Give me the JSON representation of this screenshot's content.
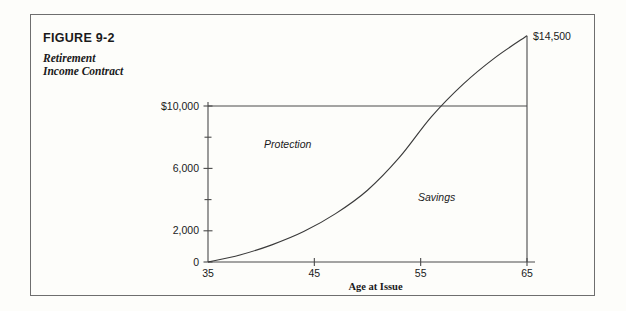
{
  "figure": {
    "number": "FIGURE 9-2",
    "subtitle": "Retirement\nIncome Contract"
  },
  "chart_data": {
    "type": "area",
    "title": "Retirement Income Contract",
    "xlabel": "Age at Issue",
    "ylabel": "",
    "xlim": [
      35,
      65
    ],
    "ylim": [
      0,
      14500
    ],
    "grid": false,
    "legend_position": "inline-annotations",
    "x_ticks": [
      {
        "value": 35,
        "label": "35"
      },
      {
        "value": 45,
        "label": "45"
      },
      {
        "value": 55,
        "label": "55"
      },
      {
        "value": 65,
        "label": "65"
      }
    ],
    "y_ticks": [
      {
        "value": 0,
        "label": "0"
      },
      {
        "value": 2000,
        "label": "2,000"
      },
      {
        "value": 4000,
        "label": ""
      },
      {
        "value": 6000,
        "label": "6,000"
      },
      {
        "value": 8000,
        "label": ""
      },
      {
        "value": 10000,
        "label": "$10,000"
      }
    ],
    "series": [
      {
        "name": "Cash Value",
        "x": [
          35,
          38,
          41,
          44,
          47,
          50,
          53,
          56,
          59,
          62,
          65
        ],
        "values": [
          0,
          450,
          1100,
          1950,
          3100,
          4600,
          6700,
          9300,
          11400,
          13100,
          14500
        ]
      }
    ],
    "reference_lines": [
      {
        "name": "face-amount-line",
        "orientation": "horizontal",
        "value": 10000,
        "label": "$10,000"
      },
      {
        "name": "maturity-line",
        "orientation": "vertical",
        "value": 65,
        "from": 0,
        "to": 14500
      }
    ],
    "annotations": [
      {
        "name": "protection-region",
        "text": "Protection",
        "x": 42.5,
        "y": 7300
      },
      {
        "name": "savings-region",
        "text": "Savings",
        "x": 56.5,
        "y": 3900
      },
      {
        "name": "peak-value",
        "text": "$14,500",
        "x": 65,
        "y": 14500
      }
    ]
  }
}
